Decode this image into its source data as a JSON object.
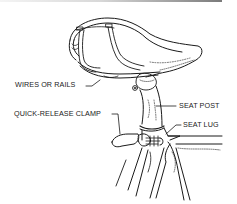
{
  "diagram": {
    "colors": {
      "ink": "#1a1a1a",
      "background": "#ffffff"
    },
    "labels": [
      {
        "id": "wires",
        "text": "WIRES OR RAILS"
      },
      {
        "id": "clamp",
        "text": "QUICK-RELEASE CLAMP"
      },
      {
        "id": "post",
        "text": "SEAT POST"
      },
      {
        "id": "lug",
        "text": "SEAT LUG"
      }
    ]
  }
}
